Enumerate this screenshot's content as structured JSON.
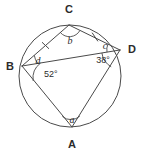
{
  "figure": {
    "shape": "circle",
    "stroke_color": "#4a4a4a",
    "text_color": "#2b2b2b",
    "background_color": "#ffffff",
    "circle": {
      "cx": 70,
      "cy": 76,
      "r": 51
    },
    "vertices": [
      {
        "id": "C",
        "label": "C",
        "x": 69,
        "y": 25,
        "label_x": 69,
        "label_y": 13
      },
      {
        "id": "D",
        "label": "D",
        "x": 120,
        "y": 50,
        "label_x": 132,
        "label_y": 53
      },
      {
        "id": "B",
        "label": "B",
        "x": 22,
        "y": 66,
        "label_x": 10,
        "label_y": 70
      },
      {
        "id": "A",
        "label": "A",
        "x": 72,
        "y": 127,
        "label_x": 72,
        "label_y": 148
      }
    ],
    "segments": [
      {
        "name": "chord-B-C",
        "from": "B",
        "to": "C",
        "ticks": 1
      },
      {
        "name": "chord-C-D",
        "from": "C",
        "to": "D",
        "ticks": 1
      },
      {
        "name": "chord-B-D",
        "from": "B",
        "to": "D",
        "ticks": 0
      },
      {
        "name": "chord-B-A",
        "from": "B",
        "to": "A",
        "ticks": 0
      },
      {
        "name": "chord-A-D",
        "from": "A",
        "to": "D",
        "ticks": 0
      }
    ],
    "angles": [
      {
        "name": "angle-at-B-known",
        "vertex": "B",
        "label": "52°",
        "kind": "value",
        "label_x": 44,
        "label_y": 77
      },
      {
        "name": "angle-at-D-known",
        "vertex": "D",
        "label": "38°",
        "kind": "value",
        "label_x": 103,
        "label_y": 63
      },
      {
        "name": "angle-a-at-A",
        "vertex": "A",
        "label": "a",
        "kind": "variable",
        "label_x": 72,
        "label_y": 123
      },
      {
        "name": "angle-b-at-C",
        "vertex": "C",
        "label": "b",
        "kind": "variable",
        "label_x": 70,
        "label_y": 44
      },
      {
        "name": "angle-c-at-D",
        "vertex": "D",
        "label": "c",
        "kind": "variable",
        "label_x": 105,
        "label_y": 49
      },
      {
        "name": "angle-d-at-B",
        "vertex": "B",
        "label": "d",
        "kind": "variable",
        "label_x": 38,
        "label_y": 64
      }
    ]
  }
}
